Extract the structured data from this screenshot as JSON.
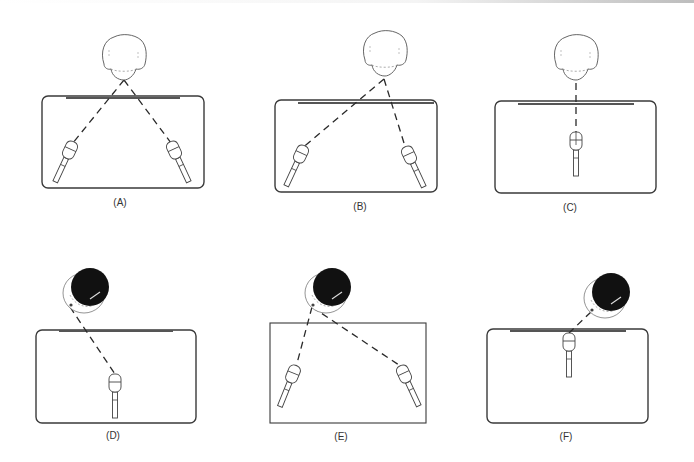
{
  "figure": {
    "colors": {
      "outline": "#3a3a3a",
      "bar": "#555555",
      "dash": "#2a2a2a",
      "head_light_fill": "#ffffff",
      "head_dark_fill": "#111111",
      "label": "#333333"
    },
    "panels": [
      {
        "id": "A",
        "label": "(A)",
        "label_x": 120,
        "label_y": 197,
        "box": {
          "x": 42,
          "y": 96,
          "w": 162,
          "h": 92,
          "rounded": true
        },
        "bar": {
          "x1": 66,
          "x2": 180,
          "y": 98
        },
        "head": {
          "style": "light",
          "cx": 124,
          "cy": 58,
          "chin_x": 124,
          "chin_y": 80
        },
        "mics": [
          {
            "x": 70,
            "y": 150,
            "angle": 25
          },
          {
            "x": 174,
            "y": 150,
            "angle": -25
          }
        ]
      },
      {
        "id": "B",
        "label": "(B)",
        "label_x": 360,
        "label_y": 201,
        "box": {
          "x": 275,
          "y": 100,
          "w": 162,
          "h": 92,
          "rounded": true
        },
        "bar": {
          "x1": 298,
          "x2": 434,
          "y": 103
        },
        "head": {
          "style": "light",
          "cx": 385,
          "cy": 54,
          "chin_x": 384,
          "chin_y": 79
        },
        "mics": [
          {
            "x": 301,
            "y": 154,
            "angle": 25
          },
          {
            "x": 409,
            "y": 155,
            "angle": -25
          }
        ]
      },
      {
        "id": "C",
        "label": "(C)",
        "label_x": 570,
        "label_y": 202,
        "box": {
          "x": 495,
          "y": 101,
          "w": 161,
          "h": 92,
          "rounded": true
        },
        "bar": {
          "x1": 518,
          "x2": 634,
          "y": 104
        },
        "head": {
          "style": "light",
          "cx": 576,
          "cy": 58,
          "chin_x": 576,
          "chin_y": 83
        },
        "mics": [
          {
            "x": 576,
            "y": 141,
            "angle": 0,
            "crosshair": true
          }
        ]
      },
      {
        "id": "D",
        "label": "(D)",
        "label_x": 113,
        "label_y": 430,
        "box": {
          "x": 36,
          "y": 330,
          "w": 160,
          "h": 93,
          "rounded": true
        },
        "bar": {
          "x1": 59,
          "x2": 173,
          "y": 331
        },
        "head": {
          "style": "dark",
          "cx": 88,
          "cy": 289,
          "chin_x": 70,
          "chin_y": 307
        },
        "mics": [
          {
            "x": 115,
            "y": 383,
            "angle": 0
          }
        ]
      },
      {
        "id": "E",
        "label": "(E)",
        "label_x": 341,
        "label_y": 431,
        "box": {
          "x": 270,
          "y": 323,
          "w": 156,
          "h": 100,
          "rounded": false
        },
        "bar": null,
        "head": {
          "style": "dark",
          "cx": 330,
          "cy": 289,
          "chin_x": 312,
          "chin_y": 307
        },
        "mics": [
          {
            "x": 293,
            "y": 374,
            "angle": 22
          },
          {
            "x": 404,
            "y": 374,
            "angle": -25
          }
        ]
      },
      {
        "id": "F",
        "label": "(F)",
        "label_x": 566,
        "label_y": 431,
        "box": {
          "x": 487,
          "y": 329,
          "w": 161,
          "h": 94,
          "rounded": true
        },
        "bar": {
          "x1": 510,
          "x2": 626,
          "y": 331
        },
        "head": {
          "style": "dark",
          "cx": 609,
          "cy": 294,
          "chin_x": 591,
          "chin_y": 312
        },
        "mics": [
          {
            "x": 569,
            "y": 342,
            "angle": 0
          }
        ]
      }
    ]
  }
}
